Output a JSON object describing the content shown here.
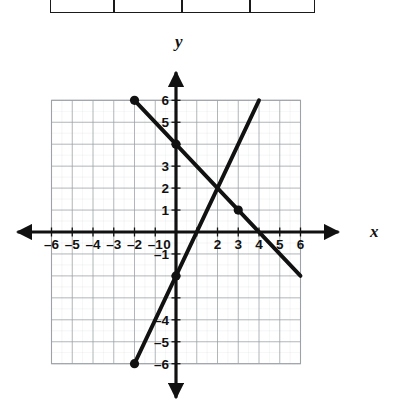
{
  "figure": {
    "type": "coordinate-plane",
    "axis_labels": {
      "x": "x",
      "y": "y"
    }
  },
  "table_fragment": {
    "visible_rows": 1,
    "columns": 4,
    "cells": [
      "",
      "",
      "",
      ""
    ]
  },
  "chart_data": {
    "type": "line",
    "title": "",
    "xlabel": "x",
    "ylabel": "y",
    "xlim": [
      -6,
      6
    ],
    "ylim": [
      -6,
      6
    ],
    "grid": true,
    "legend": "none",
    "xticks": [
      -6,
      -5,
      -4,
      -3,
      -2,
      -1,
      0,
      2,
      3,
      4,
      5,
      6
    ],
    "xtick_labels": [
      "–6",
      "–5",
      "–4",
      "–3",
      "–2",
      "–1",
      "0",
      "2",
      "3",
      "4",
      "5",
      "6"
    ],
    "yticks": [
      6,
      5,
      3,
      2,
      1,
      -1,
      -4,
      -5,
      -6
    ],
    "ytick_labels": [
      "6",
      "5",
      "3",
      "2",
      "1",
      "–1",
      "–4",
      "–5",
      "–6"
    ],
    "series": [
      {
        "name": "descending-line",
        "slope": -1,
        "intercept": 4,
        "x": [
          -2,
          6
        ],
        "y": [
          6,
          -2
        ],
        "marked_points": [
          {
            "x": -2,
            "y": 6
          },
          {
            "x": 0,
            "y": 4
          },
          {
            "x": 3,
            "y": 1
          }
        ]
      },
      {
        "name": "ascending-line",
        "slope": 2,
        "intercept": -2,
        "x": [
          -2,
          4
        ],
        "y": [
          -6,
          6
        ],
        "marked_points": [
          {
            "x": -2,
            "y": -6
          },
          {
            "x": 0,
            "y": -2
          }
        ]
      }
    ],
    "intersection": {
      "x": 2,
      "y": 2
    }
  },
  "colors": {
    "ink": "#111111",
    "grid_major": "#9aa0a6",
    "grid_minor": "#c8ccd0",
    "background": "#ffffff"
  }
}
